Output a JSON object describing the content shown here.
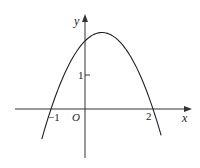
{
  "diagram": {
    "type": "function-graph",
    "function": "y = -x^2 + x + 2",
    "axes": {
      "x_label": "x",
      "y_label": "y",
      "origin_label": "O"
    },
    "ticks": {
      "x": [
        {
          "value": -1,
          "label": "−1"
        },
        {
          "value": 2,
          "label": "2"
        }
      ],
      "y": [
        {
          "value": 1,
          "label": "1"
        }
      ]
    },
    "curve": {
      "shape": "downward parabola",
      "x_intercepts": [
        -1,
        2
      ],
      "y_intercept": 2,
      "vertex": [
        0.5,
        2.25
      ],
      "x_range": [
        -1.27,
        2.24
      ]
    },
    "colors": {
      "axis": "#333333",
      "curve": "#222222",
      "background": "#ffffff"
    }
  }
}
